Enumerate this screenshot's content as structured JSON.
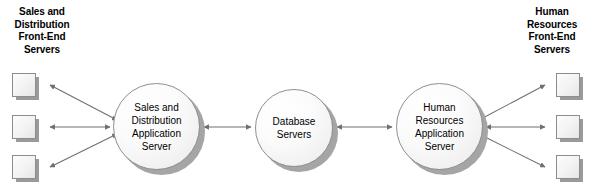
{
  "diagram": {
    "title_left": "Sales and\nDistribution\nFront-End\nServers",
    "title_right": "Human\nResources\nFront-End\nServers",
    "nodes": {
      "sales_distribution_app_server": "Sales and\nDistribution\nApplication\nServer",
      "database_servers": "Database\nServers",
      "human_resources_app_server": "Human\nResources\nApplication\nServer"
    },
    "left_front_end_servers": [
      {
        "label": ""
      },
      {
        "label": ""
      },
      {
        "label": ""
      }
    ],
    "right_front_end_servers": [
      {
        "label": ""
      },
      {
        "label": ""
      },
      {
        "label": ""
      }
    ],
    "connections": [
      {
        "from": "left-front-end-server-1",
        "to": "sales-distribution-application-server",
        "style": "double-arrow"
      },
      {
        "from": "left-front-end-server-2",
        "to": "sales-distribution-application-server",
        "style": "double-arrow"
      },
      {
        "from": "left-front-end-server-3",
        "to": "sales-distribution-application-server",
        "style": "double-arrow"
      },
      {
        "from": "sales-distribution-application-server",
        "to": "database-servers",
        "style": "double-arrow"
      },
      {
        "from": "database-servers",
        "to": "human-resources-application-server",
        "style": "double-arrow"
      },
      {
        "from": "human-resources-application-server",
        "to": "right-front-end-server-1",
        "style": "double-arrow"
      },
      {
        "from": "human-resources-application-server",
        "to": "right-front-end-server-2",
        "style": "double-arrow"
      },
      {
        "from": "human-resources-application-server",
        "to": "right-front-end-server-3",
        "style": "double-arrow"
      }
    ],
    "colors": {
      "background": "#ffffff",
      "text": "#000000",
      "node_fill": "#f4f4f4",
      "node_stroke": "#8f8f8f",
      "shadow": "#a5a5a5",
      "connector": "#6f6f6f"
    }
  }
}
